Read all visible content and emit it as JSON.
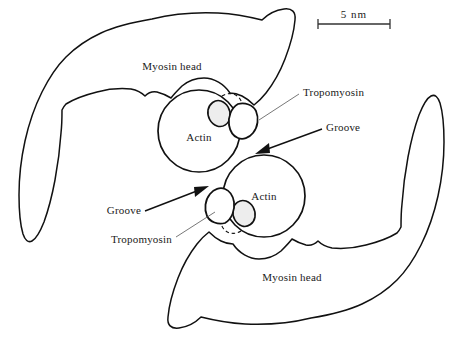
{
  "figure": {
    "background_color": "#ffffff",
    "line_color": "#111111",
    "fill_color": "#ffffff",
    "accent_fill": "#ededed"
  },
  "scale_bar": {
    "label": "5 nm",
    "value": 5,
    "unit": "nm",
    "x_start": 318,
    "x_end": 390,
    "y": 24
  },
  "labels": {
    "myosin_head_top": "Myosin head",
    "myosin_head_bottom": "Myosin head",
    "actin_top": "Actin",
    "actin_bottom": "Actin",
    "tropomyosin_right": "Tropomyosin",
    "tropomyosin_left": "Tropomyosin",
    "groove_right": "Groove",
    "groove_left": "Groove"
  },
  "structures": [
    {
      "name": "myosin-head-upper",
      "type": "myosin head",
      "orientation": "upper-left"
    },
    {
      "name": "myosin-head-lower",
      "type": "myosin head",
      "orientation": "lower-right"
    },
    {
      "name": "actin-monomer-upper",
      "type": "actin",
      "center_x": 199,
      "center_y": 131,
      "radius": 41
    },
    {
      "name": "actin-monomer-lower",
      "type": "actin",
      "center_x": 264,
      "center_y": 196,
      "radius": 41
    },
    {
      "name": "tropomyosin-upper",
      "type": "tropomyosin",
      "shape": "rounded triangle"
    },
    {
      "name": "tropomyosin-lower",
      "type": "tropomyosin",
      "shape": "rounded triangle"
    }
  ],
  "annotations": [
    {
      "name": "groove-arrow-right",
      "label": "Groove",
      "from_x": 322,
      "from_y": 129,
      "to_x": 257,
      "to_y": 153
    },
    {
      "name": "groove-arrow-left",
      "label": "Groove",
      "from_x": 145,
      "from_y": 211,
      "to_x": 207,
      "to_y": 186
    },
    {
      "name": "tropomyosin-leader-right",
      "label": "Tropomyosin",
      "from_x": 299,
      "from_y": 94,
      "to_x": 243,
      "to_y": 120
    },
    {
      "name": "tropomyosin-leader-left",
      "label": "Tropomyosin",
      "from_x": 172,
      "from_y": 238,
      "to_x": 223,
      "to_y": 210
    }
  ]
}
